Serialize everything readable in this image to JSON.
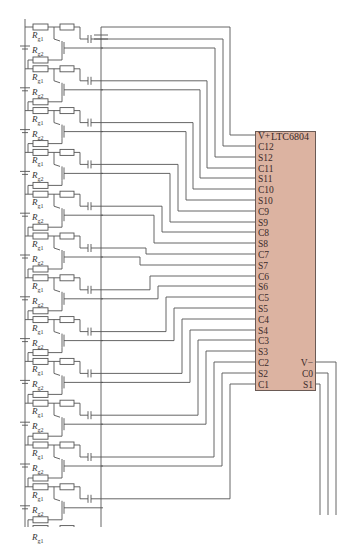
{
  "chip": {
    "name": "LTC6804",
    "box": {
      "x": 255,
      "y": 131,
      "w": 61,
      "h": 260
    },
    "fill": "#dcb3a1",
    "left_pins": [
      {
        "label": "V+",
        "y": 135
      },
      {
        "label": "C12",
        "y": 146
      },
      {
        "label": "S12",
        "y": 157
      },
      {
        "label": "C11",
        "y": 168
      },
      {
        "label": "S11",
        "y": 178
      },
      {
        "label": "C10",
        "y": 189
      },
      {
        "label": "S10",
        "y": 200
      },
      {
        "label": "C9",
        "y": 211
      },
      {
        "label": "S9",
        "y": 222
      },
      {
        "label": "C8",
        "y": 232
      },
      {
        "label": "S8",
        "y": 243
      },
      {
        "label": "C7",
        "y": 254
      },
      {
        "label": "S7",
        "y": 265
      },
      {
        "label": "C6",
        "y": 276
      },
      {
        "label": "S6",
        "y": 286
      },
      {
        "label": "C5",
        "y": 297
      },
      {
        "label": "S5",
        "y": 308
      },
      {
        "label": "C4",
        "y": 319
      },
      {
        "label": "S4",
        "y": 330
      },
      {
        "label": "C3",
        "y": 340
      },
      {
        "label": "S3",
        "y": 351
      },
      {
        "label": "C2",
        "y": 362
      },
      {
        "label": "S2",
        "y": 373
      },
      {
        "label": "C1",
        "y": 384
      }
    ],
    "right_pins": [
      {
        "label": "V−",
        "y": 362
      },
      {
        "label": "C0",
        "y": 373
      },
      {
        "label": "S1",
        "y": 384
      }
    ]
  },
  "cells": {
    "count": 12,
    "first_y": 27,
    "pitch": 41.8,
    "rail_x": 25,
    "bus_x": 101,
    "label_rg1": "R",
    "label_rg1_sub": "g1",
    "label_rg2": "R",
    "label_rg2_sub": "g2"
  },
  "colors": {
    "wire": "#555555",
    "chip_border": "#6a5a55",
    "text": "#3a2a2a"
  }
}
